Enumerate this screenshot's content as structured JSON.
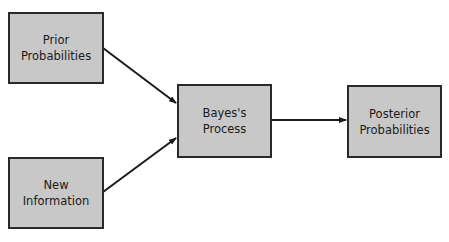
{
  "diagram": {
    "type": "flowchart",
    "background": "#ffffff",
    "box_fill": "#c8c8c8",
    "box_stroke": "#2a2a2a",
    "nodes": [
      {
        "id": "prior",
        "lines": [
          "Prior",
          "Probabilities"
        ]
      },
      {
        "id": "newinfo",
        "lines": [
          "New",
          "Information"
        ]
      },
      {
        "id": "bayes",
        "lines": [
          "Bayes's",
          "Process"
        ]
      },
      {
        "id": "posterior",
        "lines": [
          "Posterior",
          "Probabilities"
        ]
      }
    ],
    "edges": [
      {
        "from": "prior",
        "to": "bayes"
      },
      {
        "from": "newinfo",
        "to": "bayes"
      },
      {
        "from": "bayes",
        "to": "posterior"
      }
    ]
  }
}
